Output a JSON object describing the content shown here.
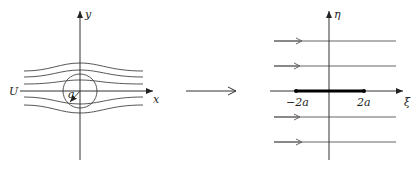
{
  "left_panel": {
    "x_axis_label": "x",
    "y_axis_label": "y",
    "freestream_label": "U",
    "radius_label": "a",
    "stroke_color": "#333333"
  },
  "mapping_arrow": {
    "description": "conformal map arrow"
  },
  "right_panel": {
    "xi_axis_label": "ξ",
    "eta_axis_label": "η",
    "plate_left_label": "−2a",
    "plate_right_label": "2a",
    "stroke_color": "#333333",
    "plate_color": "#000000"
  }
}
